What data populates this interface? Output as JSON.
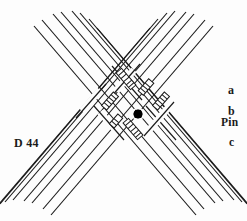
{
  "figure": {
    "plate_label": "D 44",
    "caption_labels": {
      "a": "a",
      "b": "b",
      "pin": "Pin",
      "c": "c"
    },
    "colors": {
      "ink": "#1a1a1a",
      "paper": "#fdfdfd",
      "marker": "#000000"
    },
    "marker": {
      "name": "pin-dot",
      "x": 138,
      "y": 114,
      "radius": 4.5
    },
    "strands": {
      "bundle_down_right_count": 8,
      "bundle_down_left_count": 8,
      "hatch_segments": 6
    }
  }
}
